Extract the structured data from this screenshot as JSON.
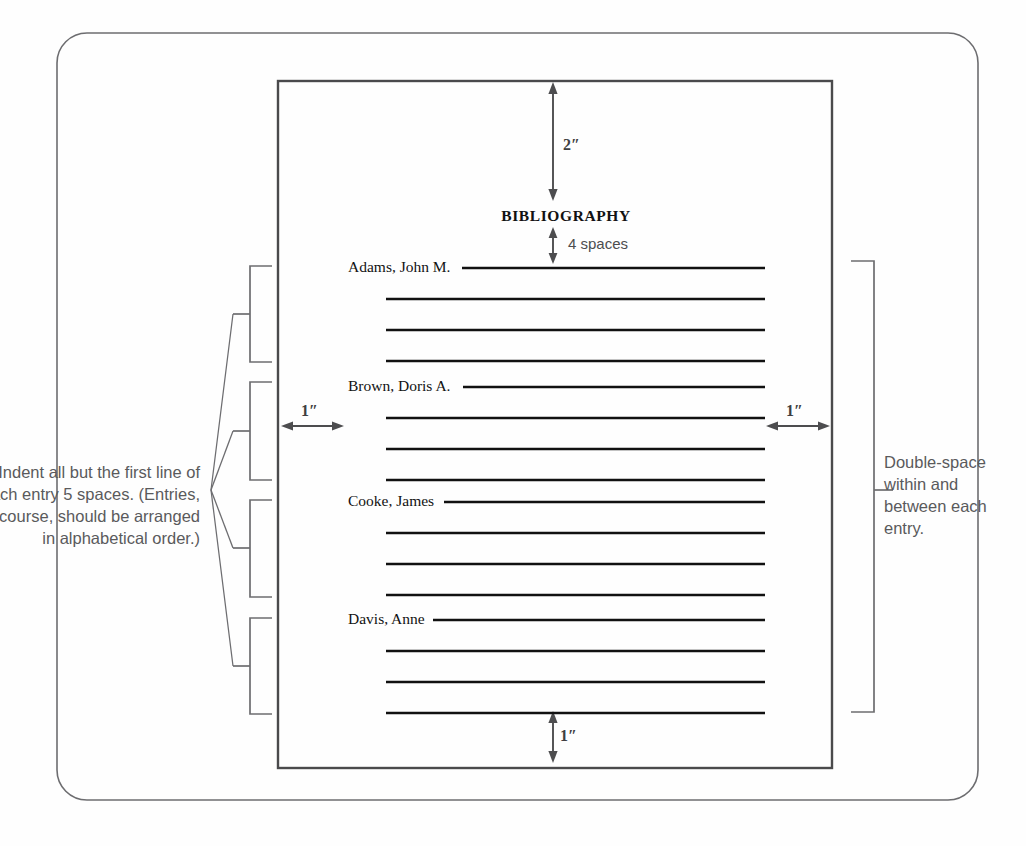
{
  "page": {
    "heading": "BIBLIOGRAPHY",
    "background_color": "#fefefe",
    "rule_color": "#111111",
    "annotation_color": "#5a5a5c"
  },
  "dimensions": {
    "top_margin": "2″",
    "heading_gap": "4 spaces",
    "left_margin": "1″",
    "right_margin": "1″",
    "bottom_margin": "1″"
  },
  "entries": [
    {
      "name": "Adams, John M.",
      "continuation_lines": 3
    },
    {
      "name": "Brown, Doris A.",
      "continuation_lines": 3
    },
    {
      "name": "Cooke, James",
      "continuation_lines": 3
    },
    {
      "name": "Davis, Anne",
      "continuation_lines": 3
    }
  ],
  "notes": {
    "left": "Indent all but the first line of each entry 5 spaces. (Entries, of course, should be arranged in alphabetical order.)",
    "right": "Double-space within and between each entry."
  }
}
